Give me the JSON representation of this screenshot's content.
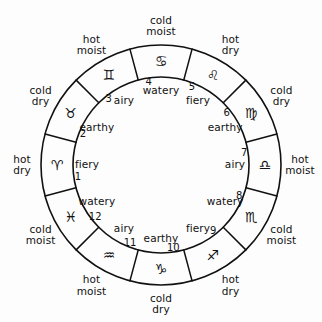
{
  "diagram": {
    "shape": "annulus",
    "sector_count": 12,
    "stroke_color": "#111111",
    "background_color": "#ffffff"
  },
  "signs": [
    {
      "number": "1",
      "name": "Aries",
      "glyph": "♈",
      "element": "fiery",
      "quality_line1": "hot",
      "quality_line2": "dry"
    },
    {
      "number": "2",
      "name": "Taurus",
      "glyph": "♉",
      "element": "earthy",
      "quality_line1": "cold",
      "quality_line2": "dry"
    },
    {
      "number": "3",
      "name": "Gemini",
      "glyph": "♊",
      "element": "airy",
      "quality_line1": "hot",
      "quality_line2": "moist"
    },
    {
      "number": "4",
      "name": "Cancer",
      "glyph": "♋",
      "element": "watery",
      "quality_line1": "cold",
      "quality_line2": "moist"
    },
    {
      "number": "5",
      "name": "Leo",
      "glyph": "♌",
      "element": "fiery",
      "quality_line1": "hot",
      "quality_line2": "dry"
    },
    {
      "number": "6",
      "name": "Virgo",
      "glyph": "♍",
      "element": "earthy",
      "quality_line1": "cold",
      "quality_line2": "dry"
    },
    {
      "number": "7",
      "name": "Libra",
      "glyph": "♎",
      "element": "airy",
      "quality_line1": "hot",
      "quality_line2": "moist"
    },
    {
      "number": "8",
      "name": "Scorpio",
      "glyph": "♏",
      "element": "watery",
      "quality_line1": "cold",
      "quality_line2": "moist"
    },
    {
      "number": "9",
      "name": "Sagittarius",
      "glyph": "♐",
      "element": "fiery",
      "quality_line1": "hot",
      "quality_line2": "dry"
    },
    {
      "number": "10",
      "name": "Capricorn",
      "glyph": "♑",
      "element": "earthy",
      "quality_line1": "cold",
      "quality_line2": "dry"
    },
    {
      "number": "11",
      "name": "Aquarius",
      "glyph": "♒",
      "element": "airy",
      "quality_line1": "hot",
      "quality_line2": "moist"
    },
    {
      "number": "12",
      "name": "Pisces",
      "glyph": "♓",
      "element": "watery",
      "quality_line1": "cold",
      "quality_line2": "moist"
    }
  ],
  "geometry": {
    "center_x": 161,
    "center_y": 165,
    "outer_radius": 120,
    "inner_radius": 88,
    "number_radius": 82,
    "glyph_radius": 104,
    "element_radius": 74,
    "quality_radius": 139,
    "start_angle_deg": 165
  }
}
